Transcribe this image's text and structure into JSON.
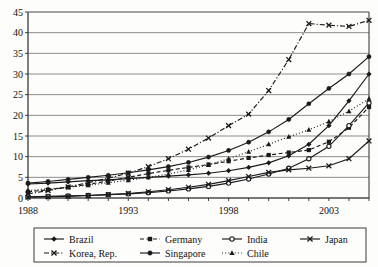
{
  "chart_data": {
    "type": "line",
    "title": "",
    "subtitle": "",
    "xlabel": "",
    "ylabel": "",
    "xlim": [
      1988,
      2005
    ],
    "ylim": [
      0,
      45
    ],
    "ytick_step": 5,
    "yticks": [
      0,
      5,
      10,
      15,
      20,
      25,
      30,
      35,
      40,
      45
    ],
    "xticks": [
      1988,
      1993,
      1998,
      2003
    ],
    "xtick_labels": [
      "1988",
      "1993",
      "1998",
      "2003"
    ],
    "grid": "horizontal",
    "legend_position": "bottom",
    "x": [
      1988,
      1989,
      1990,
      1991,
      1992,
      1993,
      1994,
      1995,
      1996,
      1997,
      1998,
      1999,
      2000,
      2001,
      2002,
      2003,
      2004,
      2005
    ],
    "series": [
      {
        "name": "Brazil",
        "marker": "filled-diamond",
        "line": "solid",
        "color": "#1a1a1a",
        "values": [
          3.4,
          3.6,
          3.9,
          4.2,
          4.4,
          4.7,
          5.0,
          5.3,
          5.6,
          6.0,
          6.6,
          7.4,
          8.5,
          10.2,
          13.0,
          17.5,
          23.5,
          30.0
        ]
      },
      {
        "name": "Germany",
        "marker": "filled-square",
        "line": "dashed",
        "color": "#1a1a1a",
        "values": [
          1.5,
          2.0,
          2.6,
          3.3,
          4.1,
          5.0,
          5.9,
          6.7,
          7.4,
          8.1,
          8.9,
          9.7,
          10.4,
          11.0,
          11.6,
          13.6,
          17.0,
          22.0
        ]
      },
      {
        "name": "India",
        "marker": "open-circle",
        "line": "solid",
        "color": "#1a1a1a",
        "values": [
          0.3,
          0.4,
          0.5,
          0.6,
          0.8,
          1.0,
          1.3,
          1.7,
          2.2,
          2.8,
          3.6,
          4.6,
          5.8,
          7.2,
          9.5,
          12.5,
          17.5,
          23.0
        ]
      },
      {
        "name": "Japan",
        "marker": "cross-x",
        "line": "solid",
        "color": "#1a1a1a",
        "values": [
          0.2,
          0.3,
          0.4,
          0.6,
          0.8,
          1.1,
          1.5,
          2.0,
          2.6,
          3.3,
          4.2,
          5.2,
          6.2,
          6.8,
          7.2,
          7.8,
          9.5,
          13.8
        ]
      },
      {
        "name": "Korea, Rep.",
        "marker": "cross-x",
        "line": "dash-dot",
        "color": "#1a1a1a",
        "values": [
          1.0,
          1.8,
          2.7,
          3.7,
          4.8,
          6.0,
          7.6,
          9.5,
          11.8,
          14.5,
          17.5,
          20.3,
          26.0,
          33.5,
          42.2,
          41.8,
          41.5,
          43.0
        ]
      },
      {
        "name": "Singapore",
        "marker": "filled-circle",
        "line": "solid",
        "color": "#1a1a1a",
        "values": [
          3.6,
          4.0,
          4.5,
          5.0,
          5.5,
          6.1,
          6.8,
          7.6,
          8.6,
          9.9,
          11.5,
          13.5,
          16.0,
          19.0,
          22.8,
          26.5,
          30.0,
          34.2
        ]
      },
      {
        "name": "Chile",
        "marker": "filled-triangle",
        "line": "dotted",
        "color": "#1a1a1a",
        "values": [
          1.8,
          2.2,
          2.6,
          3.1,
          3.7,
          4.3,
          5.0,
          5.8,
          6.8,
          8.0,
          9.5,
          11.2,
          13.0,
          14.8,
          16.5,
          18.5,
          21.0,
          24.0
        ]
      }
    ],
    "legend_entries": [
      {
        "label": "Brazil",
        "marker": "filled-diamond",
        "line": "solid"
      },
      {
        "label": "Germany",
        "marker": "filled-square",
        "line": "dashed"
      },
      {
        "label": "India",
        "marker": "open-circle",
        "line": "solid"
      },
      {
        "label": "Japan",
        "marker": "cross-x",
        "line": "solid"
      },
      {
        "label": "Korea, Rep.",
        "marker": "cross-x",
        "line": "dash-dot"
      },
      {
        "label": "Singapore",
        "marker": "filled-circle",
        "line": "solid"
      },
      {
        "label": "Chile",
        "marker": "filled-triangle",
        "line": "dotted"
      }
    ]
  },
  "colors": {
    "background": "#fdfdfc",
    "ink": "#1a1a1a",
    "grid": "#6f6f6f",
    "axis": "#2a2a2a",
    "legend_border": "#3a3a3a"
  }
}
